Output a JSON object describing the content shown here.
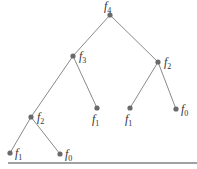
{
  "diagram": {
    "type": "binary-tree",
    "colors": {
      "edge": "#8a8a8a",
      "node": "#6a6a6a",
      "text": "#333333",
      "rule": "#444444"
    },
    "nodes": [
      {
        "id": "root",
        "base": "f",
        "sub": "4",
        "x": 110,
        "y": 15,
        "lx": 104,
        "ly": 10
      },
      {
        "id": "n_f3",
        "base": "f",
        "sub": "3",
        "x": 73,
        "y": 56,
        "lx": 79,
        "ly": 60
      },
      {
        "id": "n_f2_right",
        "base": "f",
        "sub": "2",
        "x": 158,
        "y": 62,
        "lx": 164,
        "ly": 66
      },
      {
        "id": "n_f2_left",
        "base": "f",
        "sub": "2",
        "x": 31,
        "y": 117,
        "lx": 37,
        "ly": 121
      },
      {
        "id": "n_f1_mid",
        "base": "f",
        "sub": "1",
        "x": 97,
        "y": 108,
        "lx": 92,
        "ly": 123
      },
      {
        "id": "n_f1_right",
        "base": "f",
        "sub": "1",
        "x": 130,
        "y": 108,
        "lx": 125,
        "ly": 123
      },
      {
        "id": "n_f0_right",
        "base": "f",
        "sub": "0",
        "x": 176,
        "y": 109,
        "lx": 181,
        "ly": 113
      },
      {
        "id": "n_f1_bottom",
        "base": "f",
        "sub": "1",
        "x": 10,
        "y": 153,
        "lx": 15,
        "ly": 157
      },
      {
        "id": "n_f0_bottom",
        "base": "f",
        "sub": "0",
        "x": 60,
        "y": 154,
        "lx": 65,
        "ly": 158
      }
    ],
    "edges": [
      [
        "root",
        "n_f3"
      ],
      [
        "root",
        "n_f2_right"
      ],
      [
        "n_f3",
        "n_f2_left"
      ],
      [
        "n_f3",
        "n_f1_mid"
      ],
      [
        "n_f2_right",
        "n_f1_right"
      ],
      [
        "n_f2_right",
        "n_f0_right"
      ],
      [
        "n_f2_left",
        "n_f1_bottom"
      ],
      [
        "n_f2_left",
        "n_f0_bottom"
      ]
    ],
    "rule": {
      "x1": 8,
      "x2": 197,
      "y": 163
    }
  }
}
